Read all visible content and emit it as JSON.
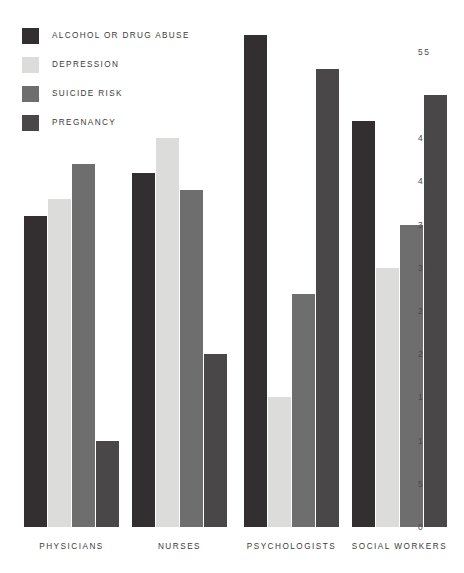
{
  "chart_data": {
    "type": "bar",
    "title": "",
    "subtitle": "",
    "xlabel": "",
    "ylabel": "",
    "orientation": "vertical",
    "grouping": "grouped",
    "grid": false,
    "legend_position": "top-left",
    "yaxis_position": "right",
    "ylim": [
      0,
      57
    ],
    "yticks": [
      0,
      5,
      10,
      15,
      20,
      25,
      30,
      35,
      40,
      45,
      55
    ],
    "ytick_labels": [
      "0",
      "5",
      "10",
      "15",
      "20",
      "25",
      "30",
      "35",
      "40",
      "45",
      "55"
    ],
    "categories": [
      "PHYSICIANS",
      "NURSES",
      "PSYCHOLOGISTS",
      "SOCIAL WORKERS"
    ],
    "series": [
      {
        "name": "ALCOHOL OR DRUG ABUSE",
        "color": "#332f30",
        "values": [
          36,
          41,
          57,
          47
        ]
      },
      {
        "name": "DEPRESSION",
        "color": "#dcdcda",
        "values": [
          38,
          45,
          15,
          30
        ]
      },
      {
        "name": "SUICIDE RISK",
        "color": "#6e6e6e",
        "values": [
          42,
          39,
          27,
          35
        ]
      },
      {
        "name": "PREGNANCY",
        "color": "#4a4748",
        "values": [
          10,
          20,
          53,
          50
        ]
      }
    ]
  },
  "legend": {
    "items": [
      {
        "label": "ALCOHOL OR DRUG ABUSE",
        "color": "#332f30"
      },
      {
        "label": "DEPRESSION",
        "color": "#dcdcda"
      },
      {
        "label": "SUICIDE RISK",
        "color": "#6e6e6e"
      },
      {
        "label": "PREGNANCY",
        "color": "#4a4748"
      }
    ]
  }
}
